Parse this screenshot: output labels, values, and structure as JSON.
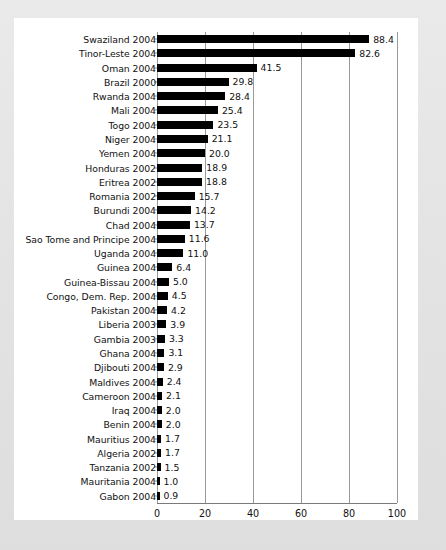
{
  "chart_data": {
    "type": "bar",
    "orientation": "horizontal",
    "title": "",
    "subtitle": "",
    "xlabel": "",
    "ylabel": "",
    "xlim": [
      0,
      100
    ],
    "xticks": [
      "0",
      "20",
      "40",
      "60",
      "80",
      "100"
    ],
    "xtick_values": [
      0,
      20,
      40,
      60,
      80,
      100
    ],
    "grid": "vertical",
    "legend": "none",
    "bar_color": "#000000",
    "panel_color": "#ffffff",
    "frame_color": "#e6e6e6",
    "categories": [
      "Swaziland 2004",
      "Tinor-Leste 2004",
      "Oman 2004",
      "Brazil 2000",
      "Rwanda 2004",
      "Mali 2004",
      "Togo 2004",
      "Niger 2004",
      "Yemen 2004",
      "Honduras 2002",
      "Eritrea 2002",
      "Romania 2002",
      "Burundi 2004",
      "Chad 2004",
      "Sao Tome and Principe 2004",
      "Uganda 2004",
      "Guinea 2004",
      "Guinea-Bissau 2004",
      "Congo, Dem. Rep. 2004",
      "Pakistan 2004",
      "Liberia 2003",
      "Gambia 2003",
      "Ghana 2004",
      "Djibouti 2004",
      "Maldives 2004",
      "Cameroon 2004",
      "Iraq 2004",
      "Benin 2004",
      "Mauritius 2004",
      "Algeria 2002",
      "Tanzania 2002",
      "Mauritania 2004",
      "Gabon 2004"
    ],
    "values": [
      88.4,
      82.6,
      41.5,
      29.8,
      28.4,
      25.4,
      23.5,
      21.1,
      20.0,
      18.9,
      18.8,
      15.7,
      14.2,
      13.7,
      11.6,
      11.0,
      6.4,
      5.0,
      4.5,
      4.2,
      3.9,
      3.3,
      3.1,
      2.9,
      2.4,
      2.1,
      2.0,
      2.0,
      1.7,
      1.7,
      1.5,
      1.0,
      0.9
    ],
    "value_labels": [
      "88.4",
      "82.6",
      "41.5",
      "29.8",
      "28.4",
      "25.4",
      "23.5",
      "21.1",
      "20.0",
      "18.9",
      "18.8",
      "15.7",
      "14.2",
      "13.7",
      "11.6",
      "11.0",
      "6.4",
      "5.0",
      "4.5",
      "4.2",
      "3.9",
      "3.3",
      "3.1",
      "2.9",
      "2.4",
      "2.1",
      "2.0",
      "2.0",
      "1.7",
      "1.7",
      "1.5",
      "1.0",
      "0.9"
    ]
  }
}
